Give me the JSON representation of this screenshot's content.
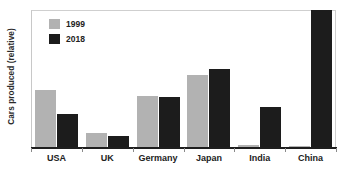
{
  "chart_data": {
    "type": "bar",
    "title": "",
    "subtitle": "",
    "xlabel": "",
    "ylabel": "Cars produced (relative)",
    "categories": [
      "USA",
      "UK",
      "Germany",
      "Japan",
      "India",
      "China"
    ],
    "series": [
      {
        "name": "1999",
        "color": "#b2b2b2",
        "values": [
          42,
          11,
          38,
          53,
          2,
          1.5
        ]
      },
      {
        "name": "2018",
        "color": "#1c1c1c",
        "values": [
          25,
          9,
          37,
          57,
          30,
          100
        ]
      }
    ],
    "ylim": [
      0,
      100
    ],
    "yticks": [],
    "ytick_labels": [],
    "grid": false,
    "legend_position": "top-left",
    "annotations": [],
    "frame_color": "#c8c8c8",
    "axis_color": "#1e1e1e",
    "background": "#ffffff"
  },
  "legend": {
    "items": [
      {
        "label": "1999",
        "color": "#b2b2b2"
      },
      {
        "label": "2018",
        "color": "#1c1c1c"
      }
    ]
  },
  "axes": {
    "y_title": "Cars produced (relative)"
  }
}
